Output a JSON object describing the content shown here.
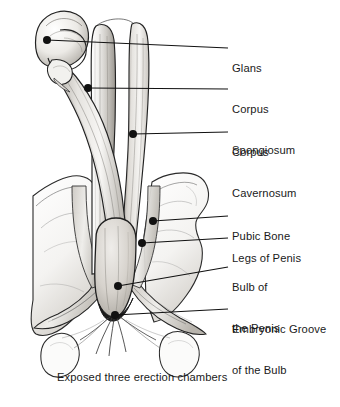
{
  "figure": {
    "title": "Exposed three erection chambers",
    "caption": "Exposed three erection chambers",
    "width": 340,
    "height": 407,
    "background_color": "#ffffff",
    "ink_color": "#1a1a1a",
    "style": "pen-and-ink anatomical line drawing with graphite shading"
  },
  "labels": [
    {
      "id": "glans",
      "text": "Glans",
      "lines": [
        "Glans"
      ],
      "text_x": 232,
      "text_y": 42,
      "dot_x": 47,
      "dot_y": 40,
      "elbow_x": 213,
      "elbow_y": 48,
      "line_end_x": 228,
      "line_end_y": 48
    },
    {
      "id": "corpus-spongiosum",
      "text": "Corpus Spongiosum",
      "lines": [
        "Corpus",
        "Spongiosum"
      ],
      "text_x": 232,
      "text_y": 82,
      "dot_x": 88,
      "dot_y": 88,
      "elbow_x": 213,
      "elbow_y": 89,
      "line_end_x": 228,
      "line_end_y": 89
    },
    {
      "id": "corpus-cavernosum",
      "text": "Corpus Cavernosum",
      "lines": [
        "Corpus",
        "Cavernosum"
      ],
      "text_x": 232,
      "text_y": 125,
      "dot_x": 133,
      "dot_y": 134,
      "elbow_x": 213,
      "elbow_y": 132,
      "line_end_x": 228,
      "line_end_y": 132
    },
    {
      "id": "pubic-bone",
      "text": "Pubic Bone",
      "lines": [
        "Pubic Bone"
      ],
      "text_x": 232,
      "text_y": 209,
      "dot_x": 153,
      "dot_y": 221,
      "elbow_x": 213,
      "elbow_y": 216,
      "line_end_x": 228,
      "line_end_y": 216
    },
    {
      "id": "legs-of-penis",
      "text": "Legs of Penis",
      "lines": [
        "Legs of Penis"
      ],
      "text_x": 232,
      "text_y": 231,
      "dot_x": 142,
      "dot_y": 243,
      "elbow_x": 213,
      "elbow_y": 238,
      "line_end_x": 228,
      "line_end_y": 238
    },
    {
      "id": "bulb-of-the-penis",
      "text": "Bulb of the Penis",
      "lines": [
        "Bulb of",
        "the Penis"
      ],
      "text_x": 232,
      "text_y": 260,
      "dot_x": 118,
      "dot_y": 286,
      "elbow_x": 213,
      "elbow_y": 267,
      "line_end_x": 228,
      "line_end_y": 267
    },
    {
      "id": "embryonic-groove-of-the-bulb",
      "text": "Embryonic Groove of the Bulb",
      "lines": [
        "Embryonic Groove",
        "of the Bulb"
      ],
      "text_x": 232,
      "text_y": 302,
      "dot_x": 115,
      "dot_y": 315,
      "elbow_x": 213,
      "elbow_y": 309,
      "line_end_x": 228,
      "line_end_y": 309
    }
  ]
}
